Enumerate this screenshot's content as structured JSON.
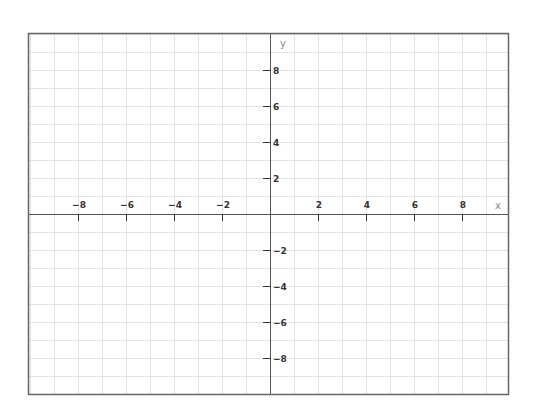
{
  "chart_data": {
    "type": "scatter",
    "title": "",
    "xlabel": "x",
    "ylabel": "y",
    "xlim": [
      -10,
      10
    ],
    "ylim": [
      -10,
      10
    ],
    "grid": true,
    "grid_step": 1,
    "x_ticks": [
      -8,
      -6,
      -4,
      -2,
      2,
      4,
      6,
      8
    ],
    "y_ticks": [
      8,
      6,
      4,
      2,
      -2,
      -4,
      -6,
      -8
    ],
    "x_tick_labels": [
      "−8",
      "−6",
      "−4",
      "−2",
      "2",
      "4",
      "6",
      "8"
    ],
    "y_tick_labels": [
      "8",
      "6",
      "4",
      "2",
      "−2",
      "−4",
      "−6",
      "−8"
    ],
    "series": [],
    "legend": null
  },
  "layout": {
    "frame": {
      "left": 28,
      "top": 33,
      "right": 508,
      "bottom": 394
    },
    "origin_px": {
      "x": 270,
      "y": 214
    },
    "px_per_unit_x": 24,
    "px_per_unit_y": 18
  },
  "colors": {
    "grid": "#e3e3e3",
    "axis": "#555555",
    "frame": "#666666",
    "tick_label": "#333333",
    "axis_name": "#888888"
  },
  "labels": {
    "x_axis": "x",
    "y_axis": "y"
  }
}
